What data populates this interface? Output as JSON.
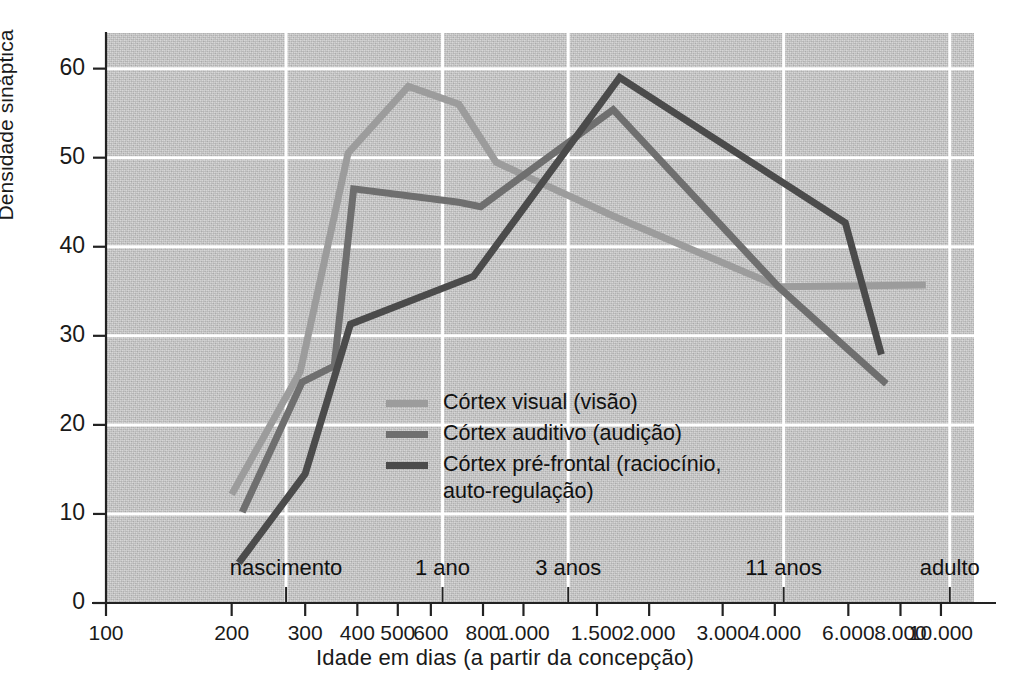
{
  "figure": {
    "ylabel": "Densidade sináptica",
    "xlabel": "Idade em dias (a partir da concepção)"
  },
  "axes": {
    "y_ticks": [
      "0",
      "10",
      "20",
      "30",
      "40",
      "50",
      "60"
    ],
    "x_ticks": [
      "100",
      "200",
      "300",
      "400",
      "500",
      "600",
      "800",
      "1.000",
      "1.500",
      "2.000",
      "3.000",
      "4.000",
      "6.000",
      "8.000",
      "10.000"
    ],
    "x_categories": [
      "nascimento",
      "1 ano",
      "3 anos",
      "11 anos",
      "adulto"
    ]
  },
  "legend": {
    "entries": [
      {
        "label": "Córtex visual (visão)",
        "color": "#9c9c9c"
      },
      {
        "label": "Córtex auditivo (audição)",
        "color": "#6f6f6f"
      },
      {
        "label": "Córtex pré-frontal (raciocínio,\nauto-regulação)",
        "color": "#4b4b4b"
      }
    ]
  },
  "colors": {
    "plot_background": "#c9c9c9",
    "gridline": "#ffffff",
    "axis": "#222222",
    "visual": "#9c9c9c",
    "auditory": "#6f6f6f",
    "prefrontal": "#4b4b4b"
  },
  "chart_data": {
    "type": "line",
    "title": "",
    "xlabel": "Idade em dias (a partir da concepção)",
    "ylabel": "Densidade sináptica",
    "xscale": "log",
    "xlim": [
      100,
      12000
    ],
    "ylim": [
      0,
      64
    ],
    "ytick_values": [
      0,
      10,
      20,
      30,
      40,
      50,
      60
    ],
    "xtick_values": [
      100,
      200,
      300,
      400,
      500,
      600,
      800,
      1000,
      1500,
      2000,
      3000,
      4000,
      6000,
      8000,
      10000
    ],
    "grid": "white gridlines at y=10..60 and at category x positions",
    "legend_position": "inside center-left",
    "category_markers": [
      {
        "label": "nascimento",
        "x": 270
      },
      {
        "label": "1 ano",
        "x": 640
      },
      {
        "label": "3 anos",
        "x": 1280
      },
      {
        "label": "11 anos",
        "x": 4200
      },
      {
        "label": "adulto",
        "x": 10500
      }
    ],
    "series": [
      {
        "name": "Córtex visual (visão)",
        "color": "#9c9c9c",
        "points": [
          {
            "x": 200,
            "y": 12.2
          },
          {
            "x": 292,
            "y": 26.0
          },
          {
            "x": 380,
            "y": 50.5
          },
          {
            "x": 530,
            "y": 58.0
          },
          {
            "x": 700,
            "y": 56.0
          },
          {
            "x": 860,
            "y": 49.5
          },
          {
            "x": 1060,
            "y": 47.5
          },
          {
            "x": 1650,
            "y": 43.4
          },
          {
            "x": 4100,
            "y": 35.5
          },
          {
            "x": 9200,
            "y": 35.7
          }
        ]
      },
      {
        "name": "Córtex auditivo (audição)",
        "color": "#6f6f6f",
        "points": [
          {
            "x": 212,
            "y": 10.2
          },
          {
            "x": 295,
            "y": 24.8
          },
          {
            "x": 352,
            "y": 26.6
          },
          {
            "x": 392,
            "y": 46.5
          },
          {
            "x": 700,
            "y": 45.0
          },
          {
            "x": 790,
            "y": 44.5
          },
          {
            "x": 1640,
            "y": 55.4
          },
          {
            "x": 4100,
            "y": 35.4
          },
          {
            "x": 7400,
            "y": 24.6
          }
        ]
      },
      {
        "name": "Córtex pré-frontal (raciocínio, auto-regulação)",
        "color": "#4b4b4b",
        "points": [
          {
            "x": 208,
            "y": 4.5
          },
          {
            "x": 300,
            "y": 14.5
          },
          {
            "x": 385,
            "y": 31.3
          },
          {
            "x": 760,
            "y": 36.7
          },
          {
            "x": 1700,
            "y": 59.0
          },
          {
            "x": 5900,
            "y": 42.7
          },
          {
            "x": 7200,
            "y": 27.9
          }
        ]
      }
    ]
  }
}
